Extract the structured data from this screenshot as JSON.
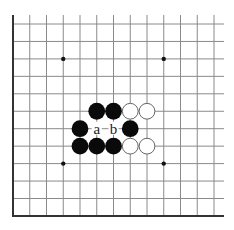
{
  "diagram": {
    "type": "go-board-fragment",
    "columns": 13,
    "rows": 12,
    "origin": {
      "x": 13,
      "y": 24
    },
    "spacing": {
      "x": 16.75,
      "y": 17.45
    },
    "line_right_extent": 224,
    "line_top_extent": 15,
    "edges": {
      "left": true,
      "bottom": true,
      "top": false,
      "right": false
    },
    "colors": {
      "line": "#8a8a8a",
      "edge": "#333333",
      "black_stone": "#0a0a0a",
      "white_stone_fill": "#ffffff",
      "white_stone_border": "#666666",
      "star_point": "#111111"
    },
    "star_points": [
      {
        "col": 3,
        "row": 2
      },
      {
        "col": 9,
        "row": 2
      },
      {
        "col": 3,
        "row": 8
      },
      {
        "col": 9,
        "row": 8
      }
    ],
    "stones": [
      {
        "col": 5,
        "row": 5,
        "color": "black"
      },
      {
        "col": 6,
        "row": 5,
        "color": "black"
      },
      {
        "col": 7,
        "row": 5,
        "color": "white"
      },
      {
        "col": 8,
        "row": 5,
        "color": "white"
      },
      {
        "col": 4,
        "row": 6,
        "color": "black"
      },
      {
        "col": 7,
        "row": 6,
        "color": "black"
      },
      {
        "col": 4,
        "row": 7,
        "color": "black"
      },
      {
        "col": 5,
        "row": 7,
        "color": "black"
      },
      {
        "col": 6,
        "row": 7,
        "color": "black"
      },
      {
        "col": 7,
        "row": 7,
        "color": "white"
      },
      {
        "col": 8,
        "row": 7,
        "color": "white"
      }
    ],
    "labels": [
      {
        "col": 5,
        "row": 6,
        "text": "a"
      },
      {
        "col": 6,
        "row": 6,
        "text": "b"
      }
    ]
  }
}
